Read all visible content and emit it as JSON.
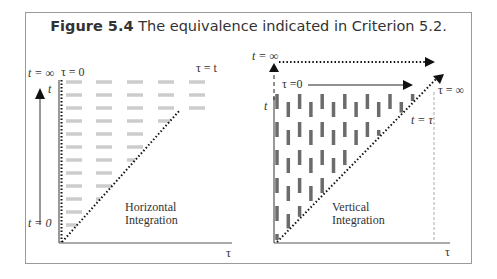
{
  "caption": {
    "label": "Figure 5.4",
    "text": "The equivalence indicated in Criterion 5.2."
  },
  "left_panel": {
    "labels": {
      "t_inf": "t = ∞",
      "tau0": "τ = 0",
      "t_axis": "t",
      "tau_eq_t": "τ = t",
      "t0": "t = 0",
      "tau_axis": "τ",
      "integration_line1": "Horizontal",
      "integration_line2": "Integration"
    },
    "dash_color": "#cccccc"
  },
  "right_panel": {
    "labels": {
      "t_inf": "t = ∞",
      "tau0": "τ =0",
      "t_axis": "t",
      "tau_inf": "τ = ∞",
      "t_eq_tau": "t = τ",
      "tau_axis": "τ",
      "integration_line1": "Vertical",
      "integration_line2": "Integration"
    },
    "dash_color": "#6b6b6b"
  },
  "colors": {
    "frame": "#9a9a9a",
    "ink": "#222222"
  }
}
